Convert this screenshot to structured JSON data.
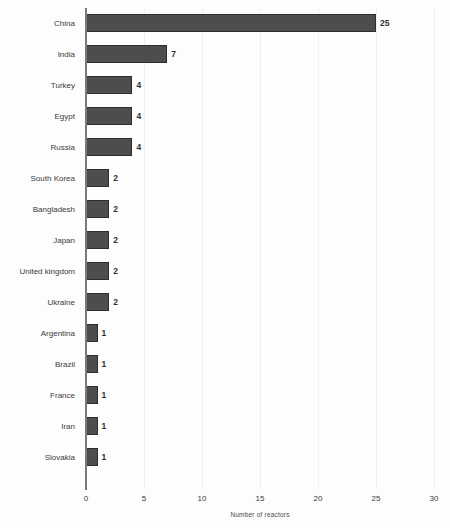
{
  "chart_data": {
    "type": "bar",
    "orientation": "horizontal",
    "title": "",
    "xlabel": "Number of reactors",
    "ylabel": "",
    "xlim": [
      0,
      30
    ],
    "xticks": [
      0,
      5,
      10,
      15,
      20,
      25,
      30
    ],
    "xtick_labels": [
      "0",
      "5",
      "10",
      "15",
      "20",
      "25",
      "30"
    ],
    "grid": "vertical",
    "legend": "none",
    "bar_color": "#4d4d4d",
    "bar_edge_color": "#2e2e2e",
    "background_color": "#fdfdfd",
    "categories": [
      "China",
      "India",
      "Turkey",
      "Egypt",
      "Russia",
      "South Korea",
      "Bangladesh",
      "Japan",
      "United kingdom",
      "Ukraine",
      "Argentina",
      "Brazil",
      "France",
      "Iran",
      "Slovakia"
    ],
    "values": [
      25,
      7,
      4,
      4,
      4,
      2,
      2,
      2,
      2,
      2,
      1,
      1,
      1,
      1,
      1
    ],
    "value_labels": [
      "25",
      "7",
      "4",
      "4",
      "4",
      "2",
      "2",
      "2",
      "2",
      "2",
      "1",
      "1",
      "1",
      "1",
      "1"
    ]
  }
}
